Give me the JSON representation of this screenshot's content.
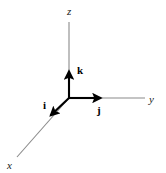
{
  "figure": {
    "width": 166,
    "height": 173,
    "background_color": "#ffffff",
    "axis_line_color": "#8a8a8a",
    "vector_color": "#000000",
    "label_color": "#1a1a1a"
  },
  "origin": {
    "x": 69,
    "y": 98
  },
  "axes": [
    {
      "name": "z-axis",
      "label": "z",
      "style": "italic-serif",
      "from": {
        "x": 69,
        "y": 98
      },
      "to": {
        "x": 69,
        "y": 22
      },
      "label_position": {
        "x": 70,
        "y": 12
      }
    },
    {
      "name": "y-axis",
      "label": "y",
      "style": "italic-serif",
      "from": {
        "x": 69,
        "y": 98
      },
      "to": {
        "x": 145,
        "y": 98
      },
      "label_position": {
        "x": 152,
        "y": 100
      }
    },
    {
      "name": "x-axis",
      "label": "x",
      "style": "italic-serif",
      "from": {
        "x": 69,
        "y": 98
      },
      "to": {
        "x": 17,
        "y": 157
      },
      "label_position": {
        "x": 10,
        "y": 166
      }
    }
  ],
  "unit_vectors": [
    {
      "name": "k-vector",
      "label": "k",
      "style": "bold-serif",
      "along_axis": "z",
      "from": {
        "x": 69,
        "y": 98
      },
      "to": {
        "x": 69,
        "y": 68
      },
      "label_position": {
        "x": 79,
        "y": 70
      }
    },
    {
      "name": "j-vector",
      "label": "j",
      "style": "bold-serif",
      "along_axis": "y",
      "from": {
        "x": 69,
        "y": 98
      },
      "to": {
        "x": 104,
        "y": 98
      },
      "label_position": {
        "x": 100,
        "y": 111
      }
    },
    {
      "name": "i-vector",
      "label": "i",
      "style": "bold-serif",
      "along_axis": "x",
      "from": {
        "x": 69,
        "y": 98
      },
      "to": {
        "x": 48,
        "y": 118
      },
      "label_position": {
        "x": 46,
        "y": 106
      }
    }
  ]
}
